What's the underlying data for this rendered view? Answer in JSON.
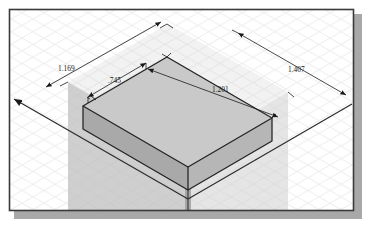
{
  "viewport": {
    "title": "isometric-cad-viewport",
    "background_color": "#ffffff",
    "grid_color": "#e3e3e6",
    "border_color": "#3a3a3a",
    "shadow_color": "#a8a8a8"
  },
  "model": {
    "name": "extruded-rectangular-block",
    "top_face_color": "#c8c8c8",
    "left_face_color": "#a9a9a9",
    "right_face_color": "#bdbdbd",
    "ghost_prism_color": "#b9b9b9",
    "edge_color": "#222222"
  },
  "dimensions": [
    {
      "id": "dim-depth-left",
      "name": "dimension-1-169",
      "value": "1.169",
      "label_x": 58,
      "label_y": 71
    },
    {
      "id": "dim-width-inner",
      "name": "dimension-0-745",
      "value": ".745",
      "label_x": 108,
      "label_y": 83
    },
    {
      "id": "dim-length-inner",
      "name": "dimension-1-201",
      "value": "1.201",
      "label_x": 212,
      "label_y": 92
    },
    {
      "id": "dim-length-right",
      "name": "dimension-1-407",
      "value": "1.407",
      "label_x": 288,
      "label_y": 72
    }
  ],
  "axes": {
    "name": "world-axis-lines",
    "color": "#2a2a2a"
  }
}
